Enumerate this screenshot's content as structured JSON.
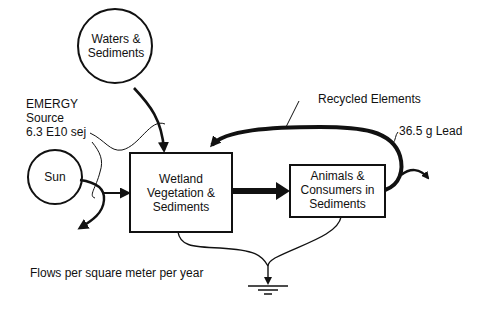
{
  "diagram": {
    "type": "emergy-systems-diagram",
    "nodes": {
      "waters": {
        "line1": "Waters &",
        "line2": "Sediments",
        "shape": "circle-source"
      },
      "sun": {
        "label": "Sun",
        "shape": "circle-source"
      },
      "wetland": {
        "line1": "Wetland",
        "line2": "Vegetation &",
        "line3": "Sediments",
        "shape": "box"
      },
      "animals": {
        "line1": "Animals &",
        "line2": "Consumers in",
        "line3": "Sediments",
        "shape": "box"
      },
      "sink": {
        "shape": "heat-sink-ground"
      }
    },
    "labels": {
      "emergy_line1": "EMERGY",
      "emergy_line2": "Source",
      "emergy_line3": "6.3 E10 sej",
      "recycled": "Recycled Elements",
      "lead": "36.5 g Lead",
      "flows_note": "Flows per square meter per year"
    },
    "colors": {
      "stroke": "#111111",
      "background": "#ffffff"
    }
  }
}
